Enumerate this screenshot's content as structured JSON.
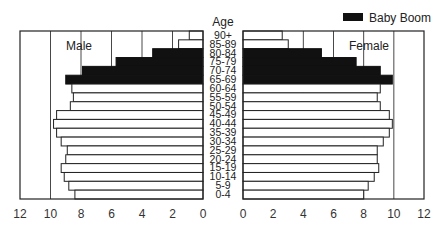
{
  "chart_data": {
    "type": "bar",
    "subtype": "population-pyramid",
    "title": "",
    "center_axis_label": "Age",
    "legend": [
      {
        "label": "Baby Boom",
        "color": "#111111"
      }
    ],
    "categories": [
      "90+",
      "85-89",
      "80-84",
      "75-79",
      "70-74",
      "65-69",
      "60-64",
      "55-59",
      "50-54",
      "45-49",
      "40-44",
      "35-39",
      "30-34",
      "25-29",
      "20-24",
      "15-19",
      "10-14",
      "5-9",
      "0-4"
    ],
    "baby_boom_categories": [
      "80-84",
      "75-79",
      "70-74",
      "65-69"
    ],
    "series": [
      {
        "name": "Male",
        "side": "left",
        "values": [
          0.9,
          1.6,
          3.3,
          5.7,
          7.9,
          9.0,
          8.6,
          8.5,
          8.7,
          9.6,
          9.8,
          9.6,
          9.3,
          8.9,
          9.0,
          9.3,
          9.1,
          8.8,
          8.4
        ]
      },
      {
        "name": "Female",
        "side": "right",
        "values": [
          2.6,
          3.0,
          5.2,
          7.5,
          9.1,
          9.9,
          9.1,
          8.9,
          9.1,
          9.7,
          9.9,
          9.7,
          9.3,
          8.9,
          8.9,
          9.0,
          8.7,
          8.3,
          8.0
        ]
      }
    ],
    "xlim": [
      0,
      12
    ],
    "xticks": [
      0,
      2,
      4,
      6,
      8,
      10,
      12
    ],
    "xlabel": "",
    "ylabel": "Age",
    "grid": true,
    "legend_position": "top-right"
  },
  "labels": {
    "age_header": "Age",
    "male": "Male",
    "female": "Female",
    "legend": "Baby Boom"
  }
}
